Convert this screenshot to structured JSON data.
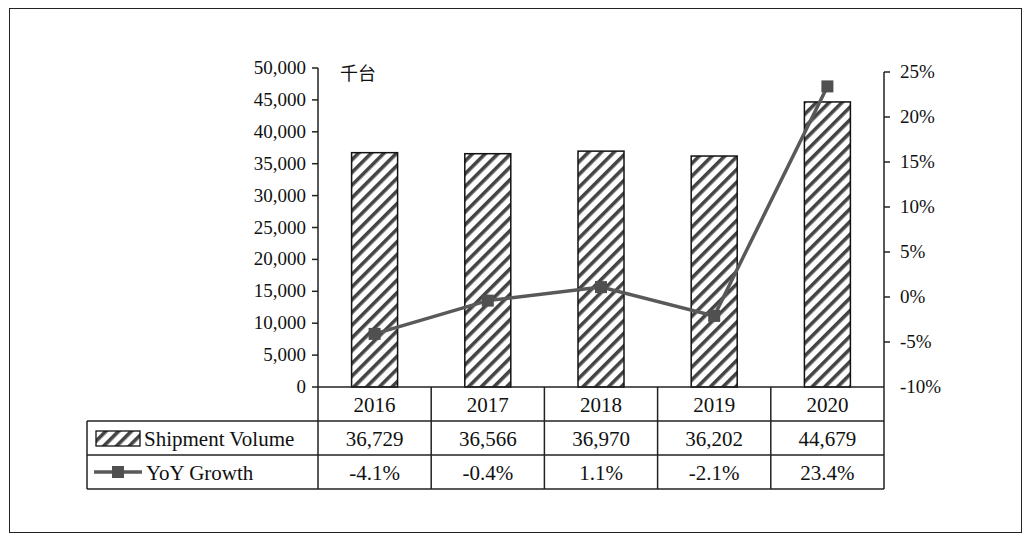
{
  "chart_data": {
    "type": "bar",
    "combo": "bar+line (dual axis) with data table",
    "title": "",
    "unit_label": "千台",
    "categories": [
      "2016",
      "2017",
      "2018",
      "2019",
      "2020"
    ],
    "series": [
      {
        "name": "Shipment Volume",
        "type": "bar",
        "axis": "left",
        "values": [
          36729,
          36566,
          36970,
          36202,
          44679
        ],
        "labels": [
          "36,729",
          "36,566",
          "36,970",
          "36,202",
          "44,679"
        ],
        "pattern": "diagonal-hatch"
      },
      {
        "name": "YoY Growth",
        "type": "line",
        "axis": "right",
        "marker": "square",
        "values": [
          -4.1,
          -0.4,
          1.1,
          -2.1,
          23.4
        ],
        "labels": [
          "-4.1%",
          "-0.4%",
          "1.1%",
          "-2.1%",
          "23.4%"
        ],
        "color": "#595959"
      }
    ],
    "left_axis": {
      "ylim": [
        0,
        50000
      ],
      "ticks": [
        "0",
        "5,000",
        "10,000",
        "15,000",
        "20,000",
        "25,000",
        "30,000",
        "35,000",
        "40,000",
        "45,000",
        "50,000"
      ]
    },
    "right_axis": {
      "ylim": [
        -10,
        25
      ],
      "ticks": [
        "-10%",
        "-5%",
        "0%",
        "5%",
        "10%",
        "15%",
        "20%",
        "25%"
      ]
    },
    "grid": false,
    "legend_position": "data-table"
  },
  "colors": {
    "line": "#595959",
    "marker": "#505050",
    "border": "#222222",
    "hatch": "#333333"
  }
}
